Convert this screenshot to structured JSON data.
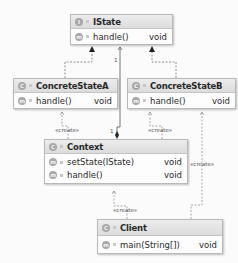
{
  "diagram": {
    "type": "UML class diagram",
    "classes": [
      {
        "id": "istate",
        "name": "IState",
        "kind_icon": "I",
        "methods": [
          {
            "name": "handle()",
            "type": "void"
          }
        ]
      },
      {
        "id": "concretestatea",
        "name": "ConcreteStateA",
        "kind_icon": "C",
        "methods": [
          {
            "name": "handle()",
            "type": "void"
          }
        ]
      },
      {
        "id": "concretestateb",
        "name": "ConcreteStateB",
        "kind_icon": "C",
        "methods": [
          {
            "name": "handle()",
            "type": "void"
          }
        ]
      },
      {
        "id": "context",
        "name": "Context",
        "kind_icon": "C",
        "methods": [
          {
            "name": "setState(IState)",
            "type": "void"
          },
          {
            "name": "handle()",
            "type": "void"
          }
        ]
      },
      {
        "id": "client",
        "name": "Client",
        "kind_icon": "C",
        "methods": [
          {
            "name": "main(String[])",
            "type": "void"
          }
        ]
      }
    ],
    "method_icon": "m",
    "relations": [
      {
        "from": "ConcreteStateA",
        "to": "IState",
        "kind": "realization"
      },
      {
        "from": "ConcreteStateB",
        "to": "IState",
        "kind": "realization"
      },
      {
        "from": "Context",
        "to": "IState",
        "kind": "composition",
        "label_from": "1",
        "label_to": "1"
      },
      {
        "from": "Context",
        "to": "ConcreteStateA",
        "kind": "dependency",
        "label": "«create»"
      },
      {
        "from": "Context",
        "to": "ConcreteStateB",
        "kind": "dependency",
        "label": "«create»"
      },
      {
        "from": "Client",
        "to": "Context",
        "kind": "dependency",
        "label": "«create»"
      },
      {
        "from": "Client",
        "to": "ConcreteStateB",
        "kind": "dependency",
        "label": "«create»"
      }
    ],
    "labels": {
      "create": "«create»",
      "mult_one": "1"
    }
  }
}
